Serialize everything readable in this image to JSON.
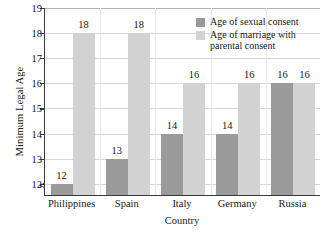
{
  "chart_data": {
    "type": "bar",
    "title": "",
    "xlabel": "Country",
    "ylabel": "Minimum Legal Age",
    "categories": [
      "Philippines",
      "Spain",
      "Italy",
      "Germany",
      "Russia"
    ],
    "series": [
      {
        "name": "Age of sexual consent",
        "color": "#9a9a9a",
        "values": [
          12,
          13,
          14,
          14,
          16
        ]
      },
      {
        "name": "Age of marriage with parental consent",
        "color": "#d2d2d2",
        "values": [
          18,
          18,
          16,
          16,
          16
        ]
      }
    ],
    "ylim": [
      11.55,
      19
    ],
    "yticks": [
      12,
      13,
      14,
      15,
      16,
      17,
      18,
      19
    ],
    "ytick_labels": [
      "12",
      "13",
      "14",
      "15",
      "16",
      "17",
      "18",
      "19"
    ],
    "grid": true,
    "axis_break": true,
    "legend_position": "upper right",
    "data_labels": [
      [
        "12",
        "18"
      ],
      [
        "13",
        "18"
      ],
      [
        "14",
        "16"
      ],
      [
        "14",
        "16"
      ],
      [
        "16",
        "16"
      ]
    ]
  },
  "legend": {
    "items": [
      {
        "label": "Age of sexual consent",
        "color": "#9a9a9a"
      },
      {
        "label": "Age of marriage with parental consent",
        "color": "#d2d2d2"
      }
    ]
  }
}
